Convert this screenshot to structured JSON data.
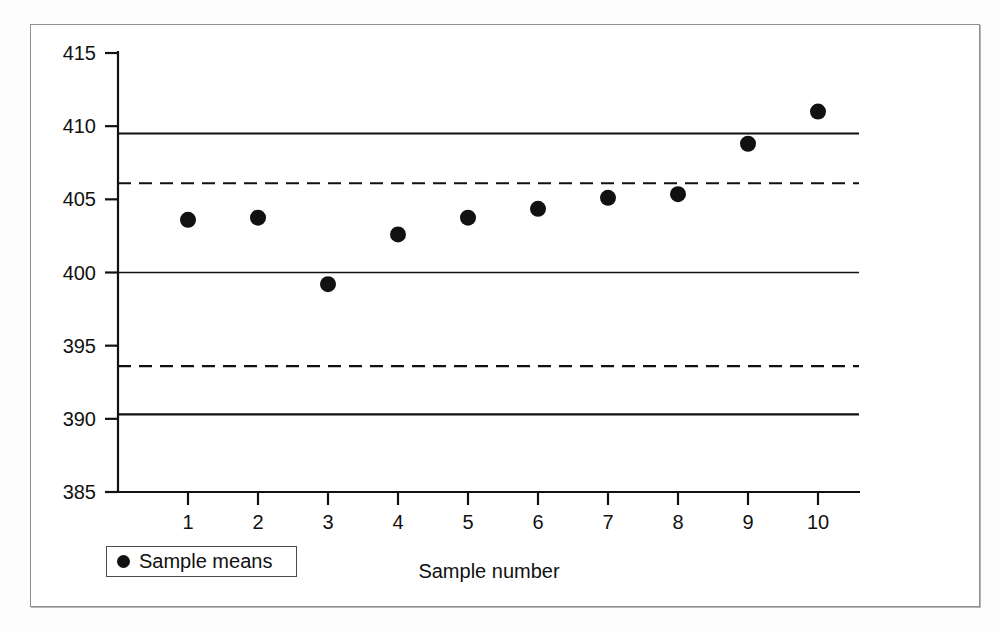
{
  "chart_data": {
    "type": "scatter",
    "title": "",
    "xlabel": "Sample number",
    "ylabel": "",
    "xlim": [
      0,
      10.6
    ],
    "ylim": [
      385,
      415
    ],
    "grid": false,
    "legend_position": "bottom-left",
    "categories": [
      "1",
      "2",
      "3",
      "4",
      "5",
      "6",
      "7",
      "8",
      "9",
      "10"
    ],
    "x": [
      1,
      2,
      3,
      4,
      5,
      6,
      7,
      8,
      9,
      10
    ],
    "series": [
      {
        "name": "Sample means",
        "marker": "filled-circle",
        "color": "#111111",
        "values": [
          403.6,
          403.75,
          399.2,
          402.6,
          403.75,
          404.35,
          405.1,
          405.35,
          408.8,
          411.0
        ]
      }
    ],
    "reference_lines": [
      {
        "name": "upper-control-limit",
        "value": 409.5,
        "style": "solid",
        "width": 2.2
      },
      {
        "name": "upper-warning-limit",
        "value": 406.1,
        "style": "dashed",
        "width": 2.2
      },
      {
        "name": "center-line",
        "value": 400.0,
        "style": "solid",
        "width": 1.6
      },
      {
        "name": "lower-warning-limit",
        "value": 393.6,
        "style": "dashed",
        "width": 2.2
      },
      {
        "name": "lower-control-limit",
        "value": 390.3,
        "style": "solid",
        "width": 2.2
      }
    ],
    "yticks": [
      415,
      410,
      405,
      400,
      395,
      390,
      385
    ],
    "ytick_labels": [
      "415",
      "410",
      "405",
      "400",
      "395",
      "390",
      "385"
    ],
    "xticks": [
      1,
      2,
      3,
      4,
      5,
      6,
      7,
      8,
      9,
      10
    ],
    "xtick_labels": [
      "1",
      "2",
      "3",
      "4",
      "5",
      "6",
      "7",
      "8",
      "9",
      "10"
    ]
  },
  "axis": {
    "y_labels": [
      "415",
      "410",
      "405",
      "400",
      "395",
      "390",
      "385"
    ],
    "x_labels": [
      "1",
      "2",
      "3",
      "4",
      "5",
      "6",
      "7",
      "8",
      "9",
      "10"
    ],
    "x_title": "Sample number"
  },
  "legend": {
    "marker_icon": "filled-circle-icon",
    "label": "Sample means"
  },
  "colors": {
    "ink": "#111111",
    "frame": "#8c8f93",
    "marker": "#111111",
    "background": "#ffffff"
  }
}
